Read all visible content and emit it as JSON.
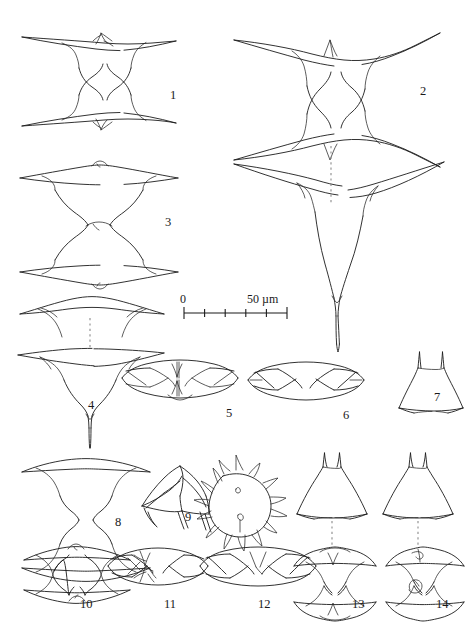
{
  "plate": {
    "title": "Line-drawing plate of desmid cells (Staurastrum-like taxa)",
    "background_color": "#ffffff",
    "ink_color": "#1b1b1b",
    "dash_color": "#8a8a8a",
    "figure_count": 14
  },
  "scale_bar": {
    "start_label": "0",
    "end_label": "50 µm",
    "unit": "µm",
    "length_um": 50,
    "divisions": 5,
    "x_start_px": 184,
    "x_end_px": 287,
    "y_px": 313
  },
  "figures": [
    {
      "id": "1",
      "label": "1",
      "label_x": 170,
      "label_y": 89,
      "view": "frontal-view-cell-with-long-arms"
    },
    {
      "id": "2",
      "label": "2",
      "label_x": 420,
      "label_y": 85,
      "view": "frontal-view-cell-large"
    },
    {
      "id": "3",
      "label": "3",
      "label_x": 165,
      "label_y": 216,
      "view": "frontal-view-cell"
    },
    {
      "id": "4",
      "label": "4",
      "label_x": 88,
      "label_y": 399,
      "view": "semicell-pair-with-dashed-axis"
    },
    {
      "id": "5",
      "label": "5",
      "label_x": 226,
      "label_y": 407,
      "view": "apical-view-cell"
    },
    {
      "id": "6",
      "label": "6",
      "label_x": 343,
      "label_y": 409,
      "view": "apical-view-cell"
    },
    {
      "id": "7",
      "label": "7",
      "label_x": 434,
      "label_y": 391,
      "view": "apical-view-triangular"
    },
    {
      "id": "8",
      "label": "8",
      "label_x": 115,
      "label_y": 516,
      "view": "frontal-view-cell"
    },
    {
      "id": "9",
      "label": "9",
      "label_x": 185,
      "label_y": 511,
      "view": "zygospore-with-spines-and-empty-semicells"
    },
    {
      "id": "10",
      "label": "10",
      "label_x": 80,
      "label_y": 598,
      "view": "frontal-view-cell"
    },
    {
      "id": "11",
      "label": "11",
      "label_x": 164,
      "label_y": 598,
      "view": "frontal-view-cell"
    },
    {
      "id": "12",
      "label": "12",
      "label_x": 258,
      "label_y": 598,
      "view": "apical-view-cell"
    },
    {
      "id": "13",
      "label": "13",
      "label_x": 352,
      "label_y": 598,
      "view": "frontal-view-with-apical-view-above"
    },
    {
      "id": "14",
      "label": "14",
      "label_x": 436,
      "label_y": 598,
      "view": "frontal-view-with-apical-view-above"
    }
  ]
}
